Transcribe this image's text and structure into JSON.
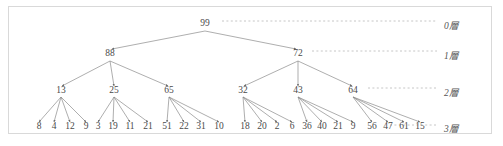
{
  "figure": {
    "border_color": "#d9d9d9",
    "edge_color": "#8b8b8b",
    "text_color": "#4a4a4a",
    "dash_color": "#b8b8b8",
    "background": "#ffffff"
  },
  "tree": {
    "root": {
      "label": "99",
      "x": 205,
      "y": 26
    },
    "level1": [
      {
        "label": "88",
        "x": 110,
        "y": 56
      },
      {
        "label": "72",
        "x": 298,
        "y": 56
      }
    ],
    "level2": [
      {
        "label": "13",
        "x": 61,
        "y": 93
      },
      {
        "label": "25",
        "x": 114,
        "y": 93
      },
      {
        "label": "65",
        "x": 169,
        "y": 93
      },
      {
        "label": "32",
        "x": 243,
        "y": 93
      },
      {
        "label": "43",
        "x": 298,
        "y": 93
      },
      {
        "label": "64",
        "x": 353,
        "y": 93
      }
    ],
    "level3": [
      {
        "label": "8",
        "x": 39,
        "y": 129
      },
      {
        "label": "4",
        "x": 54,
        "y": 129
      },
      {
        "label": "12",
        "x": 70,
        "y": 129
      },
      {
        "label": "9",
        "x": 86,
        "y": 129
      },
      {
        "label": "3",
        "x": 98,
        "y": 129
      },
      {
        "label": "19",
        "x": 113,
        "y": 129
      },
      {
        "label": "11",
        "x": 130,
        "y": 129
      },
      {
        "label": "21",
        "x": 148,
        "y": 129
      },
      {
        "label": "51",
        "x": 167,
        "y": 129
      },
      {
        "label": "22",
        "x": 184,
        "y": 129
      },
      {
        "label": "31",
        "x": 201,
        "y": 129
      },
      {
        "label": "10",
        "x": 219,
        "y": 129
      },
      {
        "label": "18",
        "x": 245,
        "y": 129
      },
      {
        "label": "20",
        "x": 262,
        "y": 129
      },
      {
        "label": "2",
        "x": 277,
        "y": 129
      },
      {
        "label": "6",
        "x": 292,
        "y": 129
      },
      {
        "label": "36",
        "x": 307,
        "y": 129
      },
      {
        "label": "40",
        "x": 322,
        "y": 129
      },
      {
        "label": "21",
        "x": 338,
        "y": 129
      },
      {
        "label": "9",
        "x": 353,
        "y": 129
      },
      {
        "label": "56",
        "x": 372,
        "y": 129
      },
      {
        "label": "47",
        "x": 388,
        "y": 129
      },
      {
        "label": "61",
        "x": 404,
        "y": 129
      },
      {
        "label": "15",
        "x": 420,
        "y": 129
      }
    ],
    "edges": [
      {
        "x1": 205,
        "y1": 31,
        "x2": 112,
        "y2": 49
      },
      {
        "x1": 205,
        "y1": 31,
        "x2": 296,
        "y2": 49
      },
      {
        "x1": 110,
        "y1": 61,
        "x2": 62,
        "y2": 86
      },
      {
        "x1": 110,
        "y1": 61,
        "x2": 114,
        "y2": 86
      },
      {
        "x1": 110,
        "y1": 61,
        "x2": 168,
        "y2": 86
      },
      {
        "x1": 298,
        "y1": 61,
        "x2": 244,
        "y2": 86
      },
      {
        "x1": 298,
        "y1": 61,
        "x2": 298,
        "y2": 86
      },
      {
        "x1": 298,
        "y1": 61,
        "x2": 352,
        "y2": 86
      },
      {
        "x1": 61,
        "y1": 97,
        "x2": 39,
        "y2": 122
      },
      {
        "x1": 61,
        "y1": 97,
        "x2": 54,
        "y2": 122
      },
      {
        "x1": 61,
        "y1": 97,
        "x2": 70,
        "y2": 122
      },
      {
        "x1": 61,
        "y1": 97,
        "x2": 86,
        "y2": 122
      },
      {
        "x1": 114,
        "y1": 97,
        "x2": 98,
        "y2": 122
      },
      {
        "x1": 114,
        "y1": 97,
        "x2": 113,
        "y2": 122
      },
      {
        "x1": 114,
        "y1": 97,
        "x2": 130,
        "y2": 122
      },
      {
        "x1": 114,
        "y1": 97,
        "x2": 148,
        "y2": 122
      },
      {
        "x1": 169,
        "y1": 97,
        "x2": 167,
        "y2": 122
      },
      {
        "x1": 169,
        "y1": 97,
        "x2": 184,
        "y2": 122
      },
      {
        "x1": 169,
        "y1": 97,
        "x2": 201,
        "y2": 122
      },
      {
        "x1": 169,
        "y1": 97,
        "x2": 219,
        "y2": 122
      },
      {
        "x1": 243,
        "y1": 97,
        "x2": 245,
        "y2": 122
      },
      {
        "x1": 243,
        "y1": 97,
        "x2": 262,
        "y2": 122
      },
      {
        "x1": 243,
        "y1": 97,
        "x2": 277,
        "y2": 122
      },
      {
        "x1": 243,
        "y1": 97,
        "x2": 292,
        "y2": 122
      },
      {
        "x1": 298,
        "y1": 97,
        "x2": 307,
        "y2": 122
      },
      {
        "x1": 298,
        "y1": 97,
        "x2": 322,
        "y2": 122
      },
      {
        "x1": 298,
        "y1": 97,
        "x2": 338,
        "y2": 122
      },
      {
        "x1": 298,
        "y1": 97,
        "x2": 353,
        "y2": 122
      },
      {
        "x1": 353,
        "y1": 97,
        "x2": 372,
        "y2": 122
      },
      {
        "x1": 353,
        "y1": 97,
        "x2": 388,
        "y2": 122
      },
      {
        "x1": 353,
        "y1": 97,
        "x2": 404,
        "y2": 122
      },
      {
        "x1": 353,
        "y1": 97,
        "x2": 420,
        "y2": 122
      }
    ]
  },
  "layers": [
    {
      "label": "0層",
      "label_x": 444,
      "label_y": 29,
      "dash_x1": 222,
      "dash_x2": 437,
      "dash_y": 21
    },
    {
      "label": "1層",
      "label_x": 444,
      "label_y": 59,
      "dash_x1": 312,
      "dash_x2": 437,
      "dash_y": 51
    },
    {
      "label": "2層",
      "label_x": 444,
      "label_y": 96,
      "dash_x1": 368,
      "dash_x2": 437,
      "dash_y": 88
    },
    {
      "label": "3層",
      "label_x": 444,
      "label_y": 132,
      "dash_x1": 390,
      "dash_x2": 437,
      "dash_y": 125
    }
  ]
}
